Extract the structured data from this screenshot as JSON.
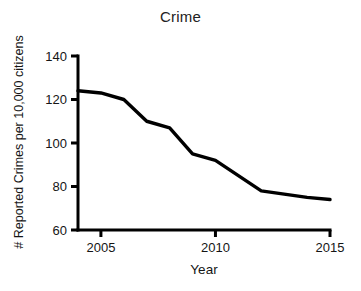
{
  "chart_data": {
    "type": "line",
    "title": "Crime",
    "xlabel": "Year",
    "ylabel": "# Reported Crimes per 10,000 citizens",
    "x": [
      2004,
      2005,
      2006,
      2007,
      2008,
      2009,
      2010,
      2011,
      2012,
      2013,
      2014,
      2015
    ],
    "values": [
      124,
      123,
      120,
      110,
      107,
      95,
      92,
      85,
      78,
      76.5,
      75,
      74
    ],
    "series": [
      {
        "name": "Reported Crimes",
        "values": [
          124,
          123,
          120,
          110,
          107,
          95,
          92,
          85,
          78,
          76.5,
          75,
          74
        ]
      }
    ],
    "xlim": [
      2004,
      2015
    ],
    "ylim": [
      60,
      140
    ],
    "xticks": [
      2005,
      2010,
      2015
    ],
    "xtick_labels": [
      "2005",
      "2010",
      "2015"
    ],
    "yticks": [
      60,
      80,
      100,
      120,
      140
    ],
    "ytick_labels": [
      "60",
      "80",
      "100",
      "120",
      "140"
    ],
    "grid": false,
    "legend": false,
    "line_color": "#000000",
    "axis_color": "#000000",
    "background_color": "#ffffff"
  }
}
